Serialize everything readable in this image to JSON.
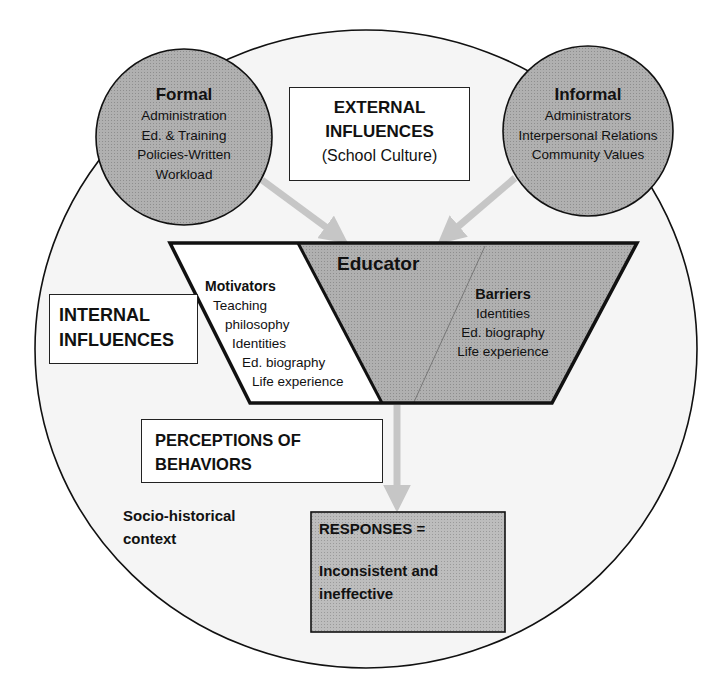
{
  "colors": {
    "circle_fill": "#a9a9a9",
    "outer_fill": "#f4f4f4",
    "stroke": "#111111",
    "arrow": "#c8c8c8",
    "box_fill": "#ffffff",
    "responses_fill": "#b3b3b3"
  },
  "formal": {
    "title": "Formal",
    "items": [
      "Administration",
      "Ed. & Training",
      "Policies-Written",
      "Workload"
    ]
  },
  "informal": {
    "title": "Informal",
    "items": [
      "Administrators",
      "Interpersonal Relations",
      "Community Values"
    ]
  },
  "external": {
    "line1": "EXTERNAL",
    "line2": "INFLUENCES",
    "line3": "(School Culture)"
  },
  "internal": {
    "line1": "INTERNAL",
    "line2": "INFLUENCES"
  },
  "educator": {
    "title": "Educator"
  },
  "motivators": {
    "title": "Motivators",
    "items": [
      "Teaching",
      "philosophy",
      "Identities",
      "Ed. biography",
      "Life experience"
    ]
  },
  "barriers": {
    "title": "Barriers",
    "items": [
      "Identities",
      "Ed. biography",
      "Life experience"
    ]
  },
  "perceptions": {
    "line1": "PERCEPTIONS OF",
    "line2": "BEHAVIORS"
  },
  "context": {
    "line1": "Socio-historical",
    "line2": "context"
  },
  "responses": {
    "line1": "RESPONSES =",
    "line2": "Inconsistent and",
    "line3": "ineffective"
  }
}
